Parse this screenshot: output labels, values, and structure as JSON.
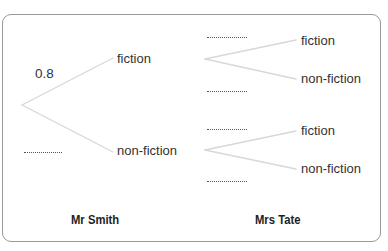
{
  "diagram": {
    "type": "probability-tree",
    "colors": {
      "branch_line": "#d8d8d8",
      "text": "#333333",
      "frame_border": "#9a9a9a"
    },
    "first_stage": {
      "person": "Mr Smith",
      "branches": [
        {
          "outcome": "fiction",
          "probability": "0.8"
        },
        {
          "outcome": "non-fiction",
          "probability": ".........."
        }
      ]
    },
    "second_stage": {
      "person": "Mrs Tate",
      "after_fiction": {
        "branches": [
          {
            "outcome": "fiction",
            "probability": ".........."
          },
          {
            "outcome": "non-fiction",
            "probability": ".........."
          }
        ]
      },
      "after_non_fiction": {
        "branches": [
          {
            "outcome": "fiction",
            "probability": ".........."
          },
          {
            "outcome": "non-fiction",
            "probability": ".........."
          }
        ]
      }
    }
  }
}
